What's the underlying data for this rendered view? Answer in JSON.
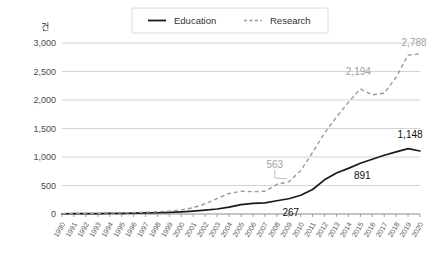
{
  "chart_data": {
    "type": "line",
    "title": "",
    "xlabel": "",
    "ylabel": "건",
    "ylim": [
      0,
      3000
    ],
    "ytick_values": [
      0,
      500,
      1000,
      1500,
      2000,
      2500,
      3000
    ],
    "ytick_labels": [
      "0",
      "500",
      "1,000",
      "1,500",
      "2,000",
      "2,500",
      "3,000"
    ],
    "grid": true,
    "legend_position": "top-center",
    "categories": [
      "1990",
      "1991",
      "1992",
      "1993",
      "1994",
      "1995",
      "1996",
      "1997",
      "1998",
      "1999",
      "2000",
      "2001",
      "2002",
      "2003",
      "2004",
      "2005",
      "2006",
      "2007",
      "2008",
      "2009",
      "2010",
      "2011",
      "2012",
      "2013",
      "2014",
      "2015",
      "2016",
      "2017",
      "2018",
      "2019",
      "2020"
    ],
    "series": [
      {
        "name": "Education",
        "style": "solid",
        "color": "#1a1a1a",
        "values": [
          4,
          5,
          6,
          8,
          10,
          12,
          15,
          18,
          22,
          28,
          38,
          52,
          68,
          88,
          120,
          165,
          185,
          196,
          232,
          267,
          330,
          430,
          600,
          720,
          800,
          891,
          960,
          1030,
          1090,
          1148,
          1105
        ]
      },
      {
        "name": "Research",
        "style": "dashed",
        "color": "#9a9a9a",
        "values": [
          6,
          8,
          10,
          13,
          16,
          20,
          25,
          32,
          40,
          52,
          72,
          110,
          180,
          270,
          360,
          400,
          392,
          400,
          520,
          563,
          760,
          1080,
          1420,
          1700,
          1960,
          2194,
          2090,
          2120,
          2400,
          2788,
          2810
        ]
      }
    ],
    "point_labels": [
      {
        "series": "Research",
        "category": "2019",
        "text": "2,788",
        "color": "#a0a0a0"
      },
      {
        "series": "Research",
        "category": "2015",
        "text": "2,194",
        "color": "#a0a0a0"
      },
      {
        "series": "Research",
        "category": "2009",
        "text": "563",
        "color": "#a0a0a0"
      },
      {
        "series": "Education",
        "category": "2019",
        "text": "1,148",
        "color": "#111111"
      },
      {
        "series": "Education",
        "category": "2015",
        "text": "891",
        "color": "#111111"
      },
      {
        "series": "Education",
        "category": "2009",
        "text": "267",
        "color": "#111111"
      }
    ]
  },
  "legend": {
    "items": [
      {
        "label": "Education",
        "style": "solid"
      },
      {
        "label": "Research",
        "style": "dashed"
      }
    ]
  },
  "axis": {
    "unit_label": "건"
  }
}
